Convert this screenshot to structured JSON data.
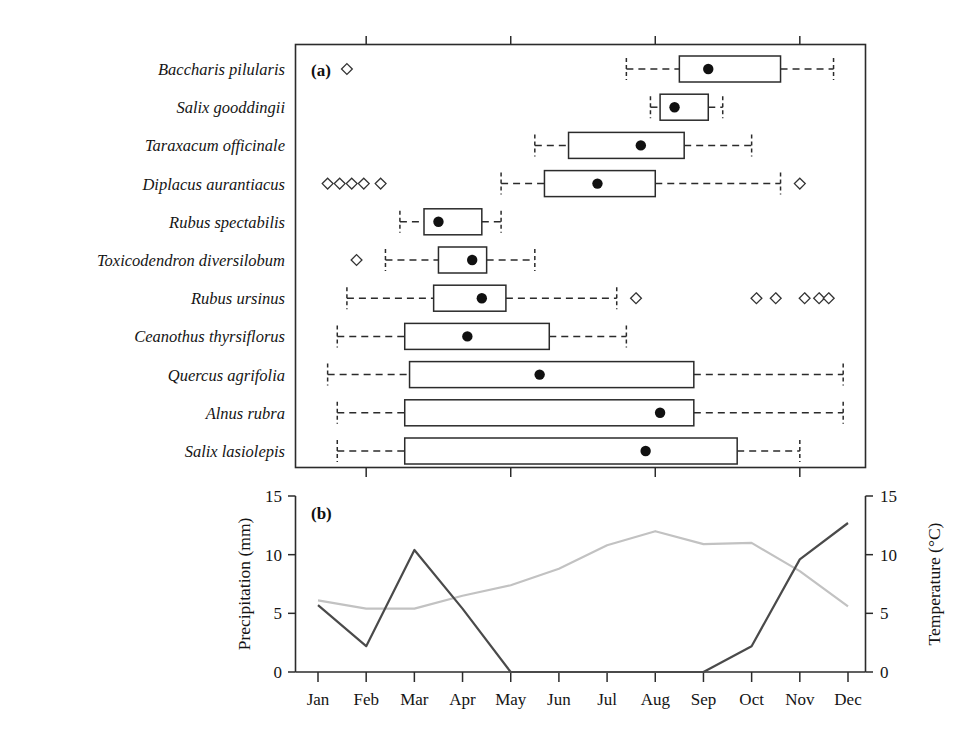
{
  "figure": {
    "panel_a_tag": "(a)",
    "panel_b_tag": "(b)"
  },
  "chart_data": [
    {
      "type": "boxplot",
      "panel": "(a)",
      "title": "",
      "xlabel": "",
      "ylabel": "",
      "x_axis": {
        "type": "month",
        "ticks_labeled": false,
        "tick_months": [
          "Feb",
          "May",
          "Aug",
          "Nov"
        ],
        "range": [
          "Jan",
          "Dec"
        ],
        "shared_with_panel_b": true
      },
      "orientation": "horizontal",
      "marker": "mean-dot",
      "outlier_symbol": "open-diamond",
      "categories": [
        "Baccharis pilularis",
        "Salix gooddingii",
        "Taraxacum officinale",
        "Diplacus aurantiacus",
        "Rubus spectabilis",
        "Toxicodendron diversilobum",
        "Rubus ursinus",
        "Ceanothus thyrsiflorus",
        "Quercus agrifolia",
        "Alnus rubra",
        "Salix lasiolepis"
      ],
      "boxes": [
        {
          "species": "Baccharis pilularis",
          "whisker_low": 7.4,
          "q1": 8.5,
          "mean": 9.1,
          "q3": 10.6,
          "whisker_high": 11.7,
          "outliers": [
            1.6
          ]
        },
        {
          "species": "Salix gooddingii",
          "whisker_low": 7.9,
          "q1": 8.1,
          "mean": 8.4,
          "q3": 9.1,
          "whisker_high": 9.4,
          "outliers": []
        },
        {
          "species": "Taraxacum officinale",
          "whisker_low": 5.5,
          "q1": 6.2,
          "mean": 7.7,
          "q3": 8.6,
          "whisker_high": 10.0,
          "outliers": []
        },
        {
          "species": "Diplacus aurantiacus",
          "whisker_low": 4.8,
          "q1": 5.7,
          "mean": 6.8,
          "q3": 8.0,
          "whisker_high": 10.6,
          "outliers": [
            1.2,
            1.45,
            1.7,
            1.95,
            2.3,
            11.0
          ]
        },
        {
          "species": "Rubus spectabilis",
          "whisker_low": 2.7,
          "q1": 3.2,
          "mean": 3.5,
          "q3": 4.4,
          "whisker_high": 4.8,
          "outliers": []
        },
        {
          "species": "Toxicodendron diversilobum",
          "whisker_low": 2.4,
          "q1": 3.5,
          "mean": 4.2,
          "q3": 4.5,
          "whisker_high": 5.5,
          "outliers": [
            1.8
          ]
        },
        {
          "species": "Rubus ursinus",
          "whisker_low": 1.6,
          "q1": 3.4,
          "mean": 4.4,
          "q3": 4.9,
          "whisker_high": 7.2,
          "outliers": [
            7.6,
            10.1,
            10.5,
            11.1,
            11.4,
            11.6
          ]
        },
        {
          "species": "Ceanothus thyrsiflorus",
          "whisker_low": 1.4,
          "q1": 2.8,
          "mean": 4.1,
          "q3": 5.8,
          "whisker_high": 7.4,
          "outliers": []
        },
        {
          "species": "Quercus agrifolia",
          "whisker_low": 1.2,
          "q1": 2.9,
          "mean": 5.6,
          "q3": 8.8,
          "whisker_high": 11.9,
          "outliers": []
        },
        {
          "species": "Alnus rubra",
          "whisker_low": 1.4,
          "q1": 2.8,
          "mean": 8.1,
          "q3": 8.8,
          "whisker_high": 11.9,
          "outliers": []
        },
        {
          "species": "Salix lasiolepis",
          "whisker_low": 1.4,
          "q1": 2.8,
          "mean": 7.8,
          "q3": 9.7,
          "whisker_high": 11.0,
          "outliers": []
        }
      ]
    },
    {
      "type": "line",
      "panel": "(b)",
      "title": "",
      "xlabel": "",
      "categories": [
        "Jan",
        "Feb",
        "Mar",
        "Apr",
        "May",
        "Jun",
        "Jul",
        "Aug",
        "Sep",
        "Oct",
        "Nov",
        "Dec"
      ],
      "y_left": {
        "label": "Precipitation (mm)",
        "ticks": [
          "0",
          "5",
          "10",
          "15"
        ],
        "lim": [
          0,
          15
        ]
      },
      "y_right": {
        "label": "Temperature (°C)",
        "ticks": [
          "0",
          "5",
          "10",
          "15"
        ],
        "lim": [
          0,
          15
        ]
      },
      "grid": false,
      "legend": "none",
      "series": [
        {
          "name": "Precipitation (mm)",
          "axis": "left",
          "color": "#4a4a4a",
          "values": [
            5.7,
            2.2,
            10.4,
            5.4,
            0.0,
            0.0,
            0.0,
            0.0,
            0.0,
            2.2,
            9.6,
            12.7
          ]
        },
        {
          "name": "Temperature (°C)",
          "axis": "right",
          "color": "#c2c2c2",
          "values": [
            6.1,
            5.4,
            5.4,
            6.5,
            7.4,
            8.8,
            10.8,
            12.0,
            10.9,
            11.0,
            8.6,
            5.6
          ]
        }
      ]
    }
  ],
  "panel_b": {
    "y_left_label": "Precipitation (mm)",
    "y_right_label": "Temperature (°C)",
    "y_ticks": [
      "15",
      "10",
      "5",
      "0"
    ],
    "months": [
      "Jan",
      "Feb",
      "Mar",
      "Apr",
      "May",
      "Jun",
      "Jul",
      "Aug",
      "Sep",
      "Oct",
      "Nov",
      "Dec"
    ]
  },
  "species_labels": [
    "Baccharis pilularis",
    "Salix gooddingii",
    "Taraxacum officinale",
    "Diplacus aurantiacus",
    "Rubus spectabilis",
    "Toxicodendron diversilobum",
    "Rubus ursinus",
    "Ceanothus thyrsiflorus",
    "Quercus agrifolia",
    "Alnus rubra",
    "Salix lasiolepis"
  ],
  "colors": {
    "precipitation": "#4a4a4a",
    "temperature": "#c2c2c2",
    "axis": "#2b2b2b"
  }
}
